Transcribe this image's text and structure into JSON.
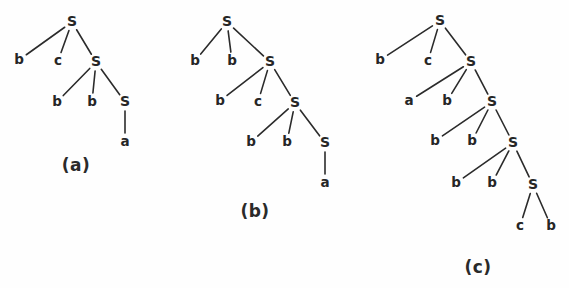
{
  "figure": {
    "background_color": "#fefefe",
    "ink_color": "#262626",
    "width": 569,
    "height": 288
  },
  "trees": [
    {
      "id": "tree-a",
      "caption": "(a)",
      "caption_pos": {
        "x": 76,
        "y": 166
      },
      "nodes": [
        {
          "id": "a-n0",
          "label": "S",
          "kind": "nonterminal",
          "x": 72,
          "y": 22
        },
        {
          "id": "a-n1",
          "label": "b",
          "kind": "terminal",
          "x": 19,
          "y": 60
        },
        {
          "id": "a-n2",
          "label": "c",
          "kind": "terminal",
          "x": 58,
          "y": 61
        },
        {
          "id": "a-n3",
          "label": "S",
          "kind": "nonterminal",
          "x": 96,
          "y": 62
        },
        {
          "id": "a-n4",
          "label": "b",
          "kind": "terminal",
          "x": 57,
          "y": 102
        },
        {
          "id": "a-n5",
          "label": "b",
          "kind": "terminal",
          "x": 92,
          "y": 102
        },
        {
          "id": "a-n6",
          "label": "S",
          "kind": "nonterminal",
          "x": 125,
          "y": 102
        },
        {
          "id": "a-n7",
          "label": "a",
          "kind": "terminal",
          "x": 125,
          "y": 142
        }
      ],
      "edges": [
        {
          "from": "a-n0",
          "to": "a-n1"
        },
        {
          "from": "a-n0",
          "to": "a-n2"
        },
        {
          "from": "a-n0",
          "to": "a-n3"
        },
        {
          "from": "a-n3",
          "to": "a-n4"
        },
        {
          "from": "a-n3",
          "to": "a-n5"
        },
        {
          "from": "a-n3",
          "to": "a-n6"
        },
        {
          "from": "a-n6",
          "to": "a-n7"
        }
      ],
      "yield": "bcbba"
    },
    {
      "id": "tree-b",
      "caption": "(b)",
      "caption_pos": {
        "x": 255,
        "y": 212
      },
      "nodes": [
        {
          "id": "b-n0",
          "label": "S",
          "kind": "nonterminal",
          "x": 227,
          "y": 22
        },
        {
          "id": "b-n1",
          "label": "b",
          "kind": "terminal",
          "x": 195,
          "y": 61
        },
        {
          "id": "b-n2",
          "label": "b",
          "kind": "terminal",
          "x": 232,
          "y": 61
        },
        {
          "id": "b-n3",
          "label": "S",
          "kind": "nonterminal",
          "x": 270,
          "y": 62
        },
        {
          "id": "b-n4",
          "label": "b",
          "kind": "terminal",
          "x": 220,
          "y": 101
        },
        {
          "id": "b-n5",
          "label": "c",
          "kind": "terminal",
          "x": 258,
          "y": 102
        },
        {
          "id": "b-n6",
          "label": "S",
          "kind": "nonterminal",
          "x": 295,
          "y": 103
        },
        {
          "id": "b-n7",
          "label": "b",
          "kind": "terminal",
          "x": 251,
          "y": 142
        },
        {
          "id": "b-n8",
          "label": "b",
          "kind": "terminal",
          "x": 287,
          "y": 142
        },
        {
          "id": "b-n9",
          "label": "S",
          "kind": "nonterminal",
          "x": 325,
          "y": 143
        },
        {
          "id": "b-n10",
          "label": "a",
          "kind": "terminal",
          "x": 325,
          "y": 183
        }
      ],
      "edges": [
        {
          "from": "b-n0",
          "to": "b-n1"
        },
        {
          "from": "b-n0",
          "to": "b-n2"
        },
        {
          "from": "b-n0",
          "to": "b-n3"
        },
        {
          "from": "b-n3",
          "to": "b-n4"
        },
        {
          "from": "b-n3",
          "to": "b-n5"
        },
        {
          "from": "b-n3",
          "to": "b-n6"
        },
        {
          "from": "b-n6",
          "to": "b-n7"
        },
        {
          "from": "b-n6",
          "to": "b-n8"
        },
        {
          "from": "b-n6",
          "to": "b-n9"
        },
        {
          "from": "b-n9",
          "to": "b-n10"
        }
      ],
      "yield": "bbbcbba"
    },
    {
      "id": "tree-c",
      "caption": "(c)",
      "caption_pos": {
        "x": 478,
        "y": 268
      },
      "nodes": [
        {
          "id": "c-n0",
          "label": "S",
          "kind": "nonterminal",
          "x": 440,
          "y": 21
        },
        {
          "id": "c-n1",
          "label": "b",
          "kind": "terminal",
          "x": 380,
          "y": 60
        },
        {
          "id": "c-n2",
          "label": "c",
          "kind": "terminal",
          "x": 428,
          "y": 61
        },
        {
          "id": "c-n3",
          "label": "S",
          "kind": "nonterminal",
          "x": 471,
          "y": 62
        },
        {
          "id": "c-n4",
          "label": "a",
          "kind": "terminal",
          "x": 409,
          "y": 101
        },
        {
          "id": "c-n5",
          "label": "b",
          "kind": "terminal",
          "x": 447,
          "y": 101
        },
        {
          "id": "c-n6",
          "label": "S",
          "kind": "nonterminal",
          "x": 492,
          "y": 102
        },
        {
          "id": "c-n7",
          "label": "b",
          "kind": "terminal",
          "x": 435,
          "y": 141
        },
        {
          "id": "c-n8",
          "label": "b",
          "kind": "terminal",
          "x": 472,
          "y": 141
        },
        {
          "id": "c-n9",
          "label": "S",
          "kind": "nonterminal",
          "x": 513,
          "y": 143
        },
        {
          "id": "c-n10",
          "label": "b",
          "kind": "terminal",
          "x": 456,
          "y": 183
        },
        {
          "id": "c-n11",
          "label": "b",
          "kind": "terminal",
          "x": 492,
          "y": 183
        },
        {
          "id": "c-n12",
          "label": "S",
          "kind": "nonterminal",
          "x": 533,
          "y": 185
        },
        {
          "id": "c-n13",
          "label": "c",
          "kind": "terminal",
          "x": 520,
          "y": 226
        },
        {
          "id": "c-n14",
          "label": "b",
          "kind": "terminal",
          "x": 551,
          "y": 226
        }
      ],
      "edges": [
        {
          "from": "c-n0",
          "to": "c-n1"
        },
        {
          "from": "c-n0",
          "to": "c-n2"
        },
        {
          "from": "c-n0",
          "to": "c-n3"
        },
        {
          "from": "c-n3",
          "to": "c-n4"
        },
        {
          "from": "c-n3",
          "to": "c-n5"
        },
        {
          "from": "c-n3",
          "to": "c-n6"
        },
        {
          "from": "c-n6",
          "to": "c-n7"
        },
        {
          "from": "c-n6",
          "to": "c-n8"
        },
        {
          "from": "c-n6",
          "to": "c-n9"
        },
        {
          "from": "c-n9",
          "to": "c-n10"
        },
        {
          "from": "c-n9",
          "to": "c-n11"
        },
        {
          "from": "c-n9",
          "to": "c-n12"
        },
        {
          "from": "c-n12",
          "to": "c-n13"
        },
        {
          "from": "c-n12",
          "to": "c-n14"
        }
      ],
      "yield": "bcabbbbbcb"
    }
  ]
}
